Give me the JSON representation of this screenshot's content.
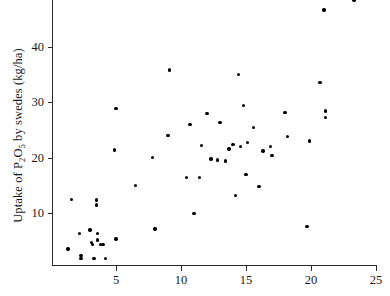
{
  "chart_data": {
    "type": "scatter",
    "title": "",
    "xlabel": "",
    "ylabel": "Uptake of P2O5 by swedes (kg/ha)",
    "ylabel_parts": {
      "pre": "Uptake of P",
      "sub1": "2",
      "mid": "O",
      "sub2": "5",
      "post": " by swedes (kg/ha)"
    },
    "xlim": [
      0.08,
      25.08
    ],
    "ylim": [
      0.7,
      48.4
    ],
    "xticks": [
      5,
      10,
      15,
      20,
      25
    ],
    "yticks": [
      10,
      20,
      30,
      40
    ],
    "xtick_labels": [
      "5",
      "10",
      "15",
      "20",
      "25"
    ],
    "ytick_labels": [
      "10",
      "20",
      "30",
      "40"
    ],
    "grid": false,
    "legend": false,
    "marker": {
      "shape": "circle",
      "color": "#000000",
      "size_px": 3.4
    },
    "n_points": 54,
    "points": [
      {
        "x": 1.6,
        "y": 12.5
      },
      {
        "x": 1.3,
        "y": 3.6
      },
      {
        "x": 2.2,
        "y": 6.4
      },
      {
        "x": 2.3,
        "y": 2.4
      },
      {
        "x": 2.3,
        "y": 1.9
      },
      {
        "x": 3.0,
        "y": 7.0
      },
      {
        "x": 3.1,
        "y": 4.8
      },
      {
        "x": 3.2,
        "y": 4.4
      },
      {
        "x": 3.3,
        "y": 1.9
      },
      {
        "x": 3.5,
        "y": 12.4
      },
      {
        "x": 3.5,
        "y": 11.5
      },
      {
        "x": 3.6,
        "y": 6.4
      },
      {
        "x": 3.6,
        "y": 5.2
      },
      {
        "x": 3.8,
        "y": 4.4
      },
      {
        "x": 4.0,
        "y": 4.4
      },
      {
        "x": 4.2,
        "y": 1.9
      },
      {
        "x": 4.9,
        "y": 21.4
      },
      {
        "x": 5.0,
        "y": 5.4
      },
      {
        "x": 5.0,
        "y": 28.9
      },
      {
        "x": 6.5,
        "y": 15.0
      },
      {
        "x": 7.8,
        "y": 20.0
      },
      {
        "x": 8.0,
        "y": 7.2
      },
      {
        "x": 9.0,
        "y": 24.0
      },
      {
        "x": 9.1,
        "y": 35.8
      },
      {
        "x": 10.4,
        "y": 16.4
      },
      {
        "x": 10.7,
        "y": 26.0
      },
      {
        "x": 11.0,
        "y": 10.0
      },
      {
        "x": 11.4,
        "y": 16.4
      },
      {
        "x": 11.6,
        "y": 22.2
      },
      {
        "x": 12.0,
        "y": 28.0
      },
      {
        "x": 12.3,
        "y": 19.8
      },
      {
        "x": 12.8,
        "y": 19.6
      },
      {
        "x": 13.0,
        "y": 26.4
      },
      {
        "x": 13.4,
        "y": 19.4
      },
      {
        "x": 13.7,
        "y": 21.6
      },
      {
        "x": 14.0,
        "y": 22.4
      },
      {
        "x": 14.2,
        "y": 13.2
      },
      {
        "x": 14.4,
        "y": 35.0
      },
      {
        "x": 14.6,
        "y": 22.0
      },
      {
        "x": 14.8,
        "y": 29.4
      },
      {
        "x": 15.0,
        "y": 17.0
      },
      {
        "x": 15.1,
        "y": 22.8
      },
      {
        "x": 15.6,
        "y": 25.4
      },
      {
        "x": 16.0,
        "y": 14.8
      },
      {
        "x": 16.3,
        "y": 21.2
      },
      {
        "x": 16.9,
        "y": 22.0
      },
      {
        "x": 17.0,
        "y": 20.4
      },
      {
        "x": 18.0,
        "y": 28.2
      },
      {
        "x": 18.2,
        "y": 23.8
      },
      {
        "x": 19.7,
        "y": 7.6
      },
      {
        "x": 19.9,
        "y": 23.0
      },
      {
        "x": 20.7,
        "y": 33.6
      },
      {
        "x": 21.0,
        "y": 46.6
      },
      {
        "x": 21.1,
        "y": 28.4
      },
      {
        "x": 21.1,
        "y": 27.2
      },
      {
        "x": 23.3,
        "y": 48.4
      }
    ]
  },
  "axes": {
    "y_title": "Uptake of P2O5 by swedes (kg/ha)"
  }
}
